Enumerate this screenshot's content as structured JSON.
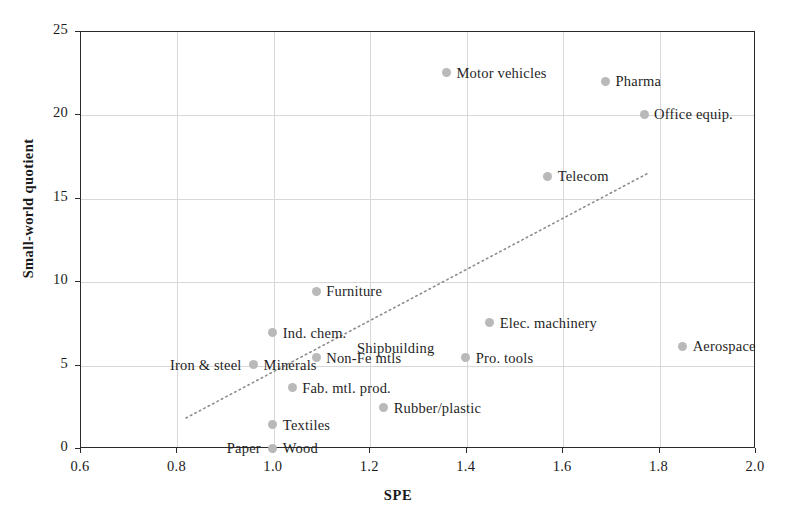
{
  "chart_data": {
    "type": "scatter",
    "title": "",
    "xlabel": "SPE",
    "ylabel": "Small-world quotient",
    "xlim": [
      0.6,
      2.0
    ],
    "ylim": [
      0,
      25
    ],
    "xticks": [
      "0.6",
      "0.8",
      "1.0",
      "1.2",
      "1.4",
      "1.6",
      "1.8",
      "2.0"
    ],
    "xtick_values": [
      0.6,
      0.8,
      1.0,
      1.2,
      1.4,
      1.6,
      1.8,
      2.0
    ],
    "yticks": [
      "0",
      "5",
      "10",
      "15",
      "20",
      "25"
    ],
    "ytick_values": [
      0,
      5,
      10,
      15,
      20,
      25
    ],
    "grid": true,
    "legend": "none",
    "marker_color": "#b9b9b9",
    "trendline": {
      "style": "dotted",
      "color": "#8c8c8c",
      "x_start": 0.82,
      "y_start": 1.8,
      "x_end": 1.78,
      "y_end": 16.5
    },
    "points": [
      {
        "label": "Motor vehicles",
        "x": 1.36,
        "y": 22.5,
        "label_side": "right"
      },
      {
        "label": "Pharma",
        "x": 1.69,
        "y": 22.0,
        "label_side": "right"
      },
      {
        "label": "Office equip.",
        "x": 1.77,
        "y": 20.0,
        "label_side": "right"
      },
      {
        "label": "Telecom",
        "x": 1.57,
        "y": 16.3,
        "label_side": "right"
      },
      {
        "label": "Furniture",
        "x": 1.09,
        "y": 9.4,
        "label_side": "right"
      },
      {
        "label": "Elec. machinery",
        "x": 1.45,
        "y": 7.5,
        "label_side": "right"
      },
      {
        "label": "Ind. chem.",
        "x": 1.0,
        "y": 6.9,
        "label_side": "right"
      },
      {
        "label": "Shipbuilding",
        "x": 1.36,
        "y": 6.0,
        "label_side": "left"
      },
      {
        "label": "Aerospace",
        "x": 1.85,
        "y": 6.1,
        "label_side": "right"
      },
      {
        "label": "Pro. tools",
        "x": 1.4,
        "y": 5.4,
        "label_side": "right"
      },
      {
        "label": "Non-Fe mtls",
        "x": 1.09,
        "y": 5.4,
        "label_side": "right"
      },
      {
        "label": "Minerals",
        "x": 0.96,
        "y": 5.0,
        "label_side": "right"
      },
      {
        "label": "Iron & steel",
        "x": 0.96,
        "y": 5.0,
        "label_side": "left"
      },
      {
        "label": "Fab. mtl. prod.",
        "x": 1.04,
        "y": 3.6,
        "label_side": "right"
      },
      {
        "label": "Rubber/plastic",
        "x": 1.23,
        "y": 2.4,
        "label_side": "right"
      },
      {
        "label": "Textiles",
        "x": 1.0,
        "y": 1.4,
        "label_side": "right"
      },
      {
        "label": "Wood",
        "x": 1.0,
        "y": 0.0,
        "label_side": "right"
      },
      {
        "label": "Paper",
        "x": 1.0,
        "y": 0.0,
        "label_side": "left"
      }
    ]
  }
}
